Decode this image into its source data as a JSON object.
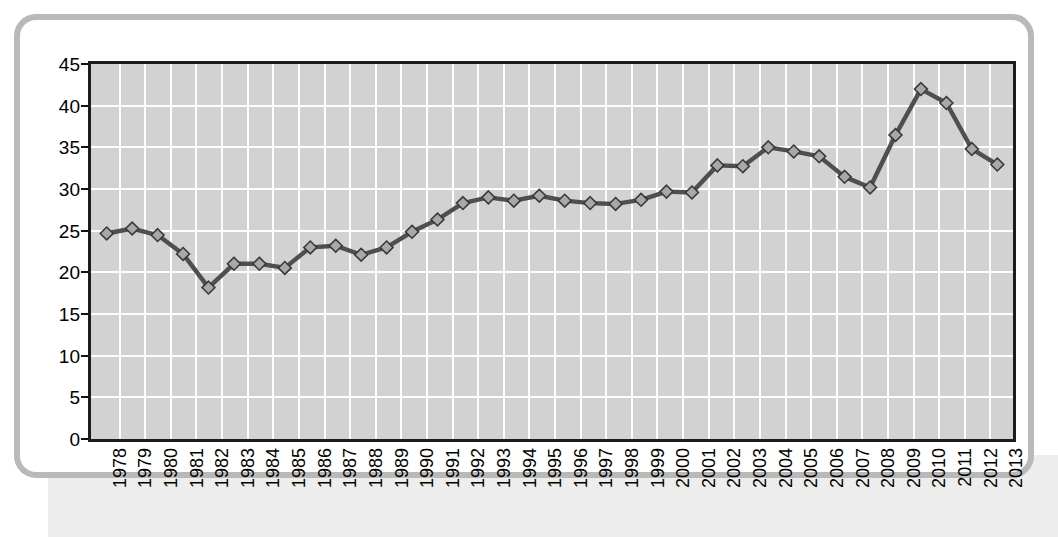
{
  "chart_data": {
    "type": "line",
    "title": "",
    "subtitle": "",
    "xlabel": "",
    "ylabel": "",
    "categories": [
      "1978",
      "1979",
      "1980",
      "1981",
      "1982",
      "1983",
      "1984",
      "1985",
      "1986",
      "1987",
      "1988",
      "1989",
      "1990",
      "1991",
      "1992",
      "1993",
      "1994",
      "1995",
      "1996",
      "1997",
      "1998",
      "1999",
      "2000",
      "2001",
      "2002",
      "2003",
      "2004",
      "2005",
      "2006",
      "2007",
      "2008",
      "2009",
      "2010",
      "2011",
      "2012",
      "2013"
    ],
    "values": [
      24.7,
      25.3,
      24.5,
      22.2,
      18.1,
      21.0,
      21.0,
      20.5,
      23.0,
      23.2,
      22.1,
      23.0,
      24.9,
      26.4,
      28.4,
      29.1,
      28.7,
      29.3,
      28.7,
      28.4,
      28.3,
      28.8,
      29.8,
      29.7,
      33.0,
      32.9,
      35.2,
      34.7,
      34.1,
      31.6,
      30.3,
      36.7,
      42.3,
      40.6,
      35.0,
      33.1
    ],
    "series": [
      {
        "name": "series-1",
        "values": [
          24.7,
          25.3,
          24.5,
          22.2,
          18.1,
          21.0,
          21.0,
          20.5,
          23.0,
          23.2,
          22.1,
          23.0,
          24.9,
          26.4,
          28.4,
          29.1,
          28.7,
          29.3,
          28.7,
          28.4,
          28.3,
          28.8,
          29.8,
          29.7,
          33.0,
          32.9,
          35.2,
          34.7,
          34.1,
          31.6,
          30.3,
          36.7,
          42.3,
          40.6,
          35.0,
          33.1
        ],
        "marker": "diamond",
        "line_color": "#4f4f4f",
        "marker_fill": "#a8a8a8",
        "marker_edge": "#3a3a3a"
      }
    ],
    "ylim": [
      0,
      45
    ],
    "yticks": [
      0,
      5,
      10,
      15,
      20,
      25,
      30,
      35,
      40,
      45
    ],
    "ytick_labels": [
      "0",
      "5",
      "10",
      "15",
      "20",
      "25",
      "30",
      "35",
      "40",
      "45"
    ],
    "grid": true,
    "grid_color": "#fdfdfd",
    "plot_background": "#d2d2d2",
    "axis_color": "#1c1c1c",
    "legend": null,
    "legend_position": "none",
    "annotations": []
  },
  "frame": {
    "border_color": "#b9b9b9",
    "background": "#ffffff",
    "band_color": "#ededed"
  }
}
